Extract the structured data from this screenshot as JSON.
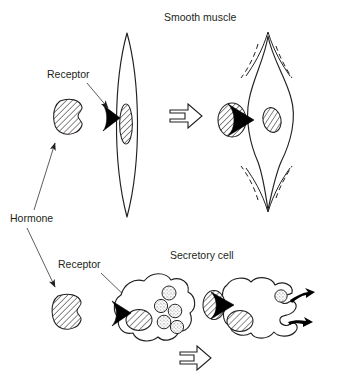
{
  "figure": {
    "background_color": "#ffffff",
    "ink_color": "#231f20",
    "width": 339,
    "height": 384
  },
  "labels": {
    "hormone": "Hormone",
    "receptor_top": "Receptor",
    "receptor_bottom": "Receptor",
    "smooth_muscle": "Smooth muscle",
    "secretory_cell": "Secretory cell"
  },
  "panels": [
    {
      "id": "smooth-muscle",
      "title": "Smooth muscle",
      "before": {
        "cell_shape": "spindle",
        "state": "relaxed",
        "nucleus": "elongated-hatched-ellipse",
        "receptor": "black-wedge-on-membrane",
        "hormone_bound": false
      },
      "after": {
        "cell_shape": "bulged-spindle",
        "state": "contracted",
        "nucleus": "round-hatched-ellipse",
        "receptor": "black-wedge-on-membrane",
        "hormone_bound": true,
        "motion_lines": 4
      }
    },
    {
      "id": "secretory-cell",
      "title": "Secretory cell",
      "before": {
        "cell_shape": "blob",
        "state": "resting",
        "nucleus": "hatched-ellipse",
        "vesicle_count": 5,
        "receptor": "black-wedge-on-membrane",
        "hormone_bound": false
      },
      "after": {
        "cell_shape": "blob-with-exocytosis-pockets",
        "state": "secreting",
        "nucleus": "hatched-ellipse",
        "vesicle_count": 1,
        "receptor": "black-wedge-on-membrane",
        "hormone_bound": true,
        "exocytosis_arrows": 2,
        "secretion_cloud": "stippled"
      }
    }
  ],
  "molecules": {
    "hormone_free_top": {
      "fill": "hatched",
      "notch": "right"
    },
    "hormone_free_bottom": {
      "fill": "hatched",
      "notch": "right"
    },
    "hormone_bound_top": {
      "fill": "hatched"
    },
    "hormone_bound_bottom": {
      "fill": "hatched"
    }
  },
  "transition_arrows": [
    {
      "id": "muscle-transition",
      "direction": "right",
      "style": "open-outline"
    },
    {
      "id": "secretory-transition",
      "direction": "right",
      "style": "open-outline"
    }
  ],
  "leader_arrows": [
    {
      "id": "hormone-to-top-molecule",
      "from": "Hormone",
      "direction": "up-right"
    },
    {
      "id": "hormone-to-bottom-molecule",
      "from": "Hormone",
      "direction": "down-right"
    },
    {
      "id": "receptor-top-leader",
      "from": "Receptor",
      "direction": "down-right"
    },
    {
      "id": "receptor-bottom-leader",
      "from": "Receptor",
      "direction": "down-right"
    }
  ]
}
